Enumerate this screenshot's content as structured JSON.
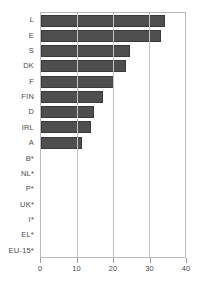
{
  "chart_data": {
    "type": "bar",
    "orientation": "horizontal",
    "title": "",
    "xlabel": "",
    "ylabel": "",
    "xlim": [
      0,
      40
    ],
    "xticks": [
      0,
      10,
      20,
      30,
      40
    ],
    "grid": true,
    "legend": "none",
    "bar_color": "#4e4e4e",
    "bar_edge_color": "#3a3a3a",
    "categories": [
      "L",
      "E",
      "S",
      "DK",
      "F",
      "FIN",
      "D",
      "IRL",
      "A",
      "B*",
      "NL*",
      "P*",
      "UK*",
      "I*",
      "EL*",
      "EU-15*"
    ],
    "values": [
      34.5,
      33.4,
      24.6,
      23.7,
      20.4,
      17.2,
      14.7,
      13.8,
      11.3,
      0,
      0,
      0,
      0,
      0,
      0,
      0
    ]
  }
}
